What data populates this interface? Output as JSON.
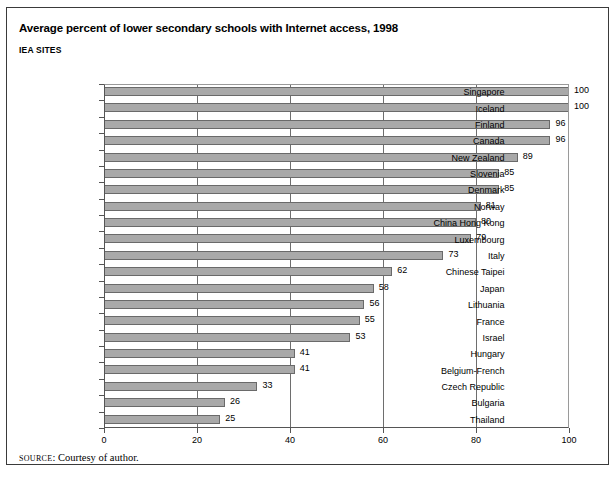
{
  "title": "Average percent of lower secondary schools with Internet access, 1998",
  "subtitle": "IEA SITES",
  "source": {
    "keyword": "SOURCE",
    "separator": ": ",
    "text": "Courtesy of author."
  },
  "colors": {
    "bar_fill": "#a9a9a9",
    "bar_stroke": "#6a6a6a",
    "gridline": "#6e6e6e",
    "axis": "#555555",
    "frame": "#3a3a3a",
    "text": "#000000",
    "background": "#ffffff"
  },
  "chart_data": {
    "type": "bar",
    "orientation": "horizontal",
    "title": "Average percent of lower secondary schools with Internet access, 1998",
    "subtitle": "IEA SITES",
    "xlabel": "",
    "ylabel": "",
    "xlim": [
      0,
      100
    ],
    "ylim": null,
    "xticks": [
      0,
      20,
      40,
      60,
      80,
      100
    ],
    "xtick_labels": [
      "0",
      "20",
      "40",
      "60",
      "80",
      "100"
    ],
    "grid": "vertical",
    "legend": null,
    "data_labels": true,
    "categories": [
      "Singapore",
      "Iceland",
      "Finland",
      "Canada",
      "New Zealand",
      "Slovenia",
      "Denmark",
      "Norway",
      "China Hong Kong",
      "Luxembourg",
      "Italy",
      "Chinese Taipei",
      "Japan",
      "Lithuania",
      "France",
      "Israel",
      "Hungary",
      "Belgium-French",
      "Czech Republic",
      "Bulgaria",
      "Thailand"
    ],
    "values": [
      100,
      100,
      96,
      96,
      89,
      85,
      85,
      81,
      80,
      79,
      73,
      62,
      58,
      56,
      55,
      53,
      41,
      41,
      33,
      26,
      25
    ],
    "value_labels": [
      "100",
      "100",
      "96",
      "96",
      "89",
      "85",
      "85",
      "81",
      "80",
      "79",
      "73",
      "62",
      "58",
      "56",
      "55",
      "53",
      "41",
      "41",
      "33",
      "26",
      "25"
    ]
  }
}
